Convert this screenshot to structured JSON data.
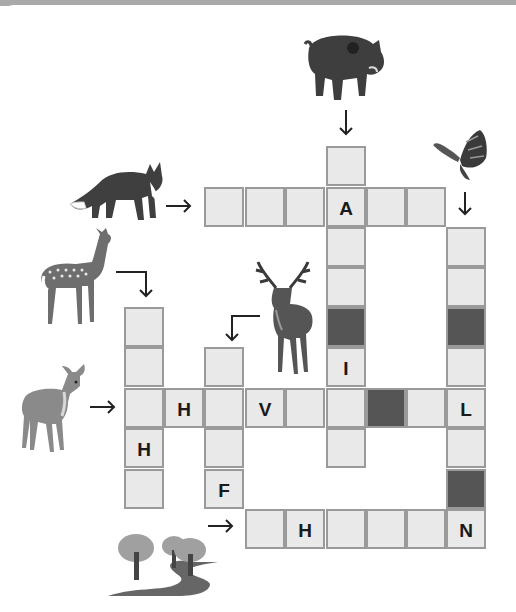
{
  "puzzle": {
    "type": "picture crossword",
    "colors": {
      "cell_fill": "#e9e9e9",
      "cell_border": "#9a9a9a",
      "blocked_cell": "#555555",
      "letter": "#1a1a1a"
    },
    "clues": [
      {
        "id": "boar",
        "picture": "wild-boar",
        "direction": "down",
        "start": [
          0,
          5
        ],
        "length": 8
      },
      {
        "id": "fox",
        "picture": "fox",
        "direction": "across",
        "start": [
          1,
          2
        ],
        "length": 6
      },
      {
        "id": "butterfly",
        "picture": "butterfly",
        "direction": "down",
        "start": [
          2,
          8
        ],
        "length": 8
      },
      {
        "id": "doe",
        "picture": "spotted-doe",
        "direction": "down",
        "start": [
          4,
          0
        ],
        "length": 5
      },
      {
        "id": "stag",
        "picture": "stag",
        "direction": "down",
        "start": [
          5,
          2
        ],
        "length": 4
      },
      {
        "id": "fawn",
        "picture": "fawn",
        "direction": "across",
        "start": [
          6,
          0
        ],
        "length": 9
      },
      {
        "id": "forest",
        "picture": "trees-and-path",
        "direction": "across",
        "start": [
          9,
          3
        ],
        "length": 6
      }
    ],
    "cells": [
      {
        "r": 0,
        "c": 5,
        "letter": ""
      },
      {
        "r": 1,
        "c": 2,
        "letter": ""
      },
      {
        "r": 1,
        "c": 3,
        "letter": ""
      },
      {
        "r": 1,
        "c": 4,
        "letter": ""
      },
      {
        "r": 1,
        "c": 5,
        "letter": "A"
      },
      {
        "r": 1,
        "c": 6,
        "letter": ""
      },
      {
        "r": 1,
        "c": 7,
        "letter": ""
      },
      {
        "r": 2,
        "c": 5,
        "letter": ""
      },
      {
        "r": 2,
        "c": 8,
        "letter": ""
      },
      {
        "r": 3,
        "c": 5,
        "letter": ""
      },
      {
        "r": 3,
        "c": 8,
        "letter": ""
      },
      {
        "r": 4,
        "c": 0,
        "letter": ""
      },
      {
        "r": 4,
        "c": 5,
        "letter": "",
        "blocked": true
      },
      {
        "r": 4,
        "c": 8,
        "letter": "",
        "blocked": true
      },
      {
        "r": 5,
        "c": 0,
        "letter": ""
      },
      {
        "r": 5,
        "c": 2,
        "letter": ""
      },
      {
        "r": 5,
        "c": 5,
        "letter": "I"
      },
      {
        "r": 5,
        "c": 8,
        "letter": ""
      },
      {
        "r": 6,
        "c": 0,
        "letter": ""
      },
      {
        "r": 6,
        "c": 1,
        "letter": "H"
      },
      {
        "r": 6,
        "c": 2,
        "letter": ""
      },
      {
        "r": 6,
        "c": 3,
        "letter": "V"
      },
      {
        "r": 6,
        "c": 4,
        "letter": ""
      },
      {
        "r": 6,
        "c": 5,
        "letter": ""
      },
      {
        "r": 6,
        "c": 6,
        "letter": "",
        "blocked": true
      },
      {
        "r": 6,
        "c": 7,
        "letter": ""
      },
      {
        "r": 6,
        "c": 8,
        "letter": "L"
      },
      {
        "r": 7,
        "c": 0,
        "letter": "H"
      },
      {
        "r": 7,
        "c": 2,
        "letter": ""
      },
      {
        "r": 7,
        "c": 5,
        "letter": ""
      },
      {
        "r": 7,
        "c": 8,
        "letter": ""
      },
      {
        "r": 8,
        "c": 0,
        "letter": ""
      },
      {
        "r": 8,
        "c": 2,
        "letter": "F"
      },
      {
        "r": 8,
        "c": 8,
        "letter": "",
        "blocked": true
      },
      {
        "r": 9,
        "c": 3,
        "letter": ""
      },
      {
        "r": 9,
        "c": 4,
        "letter": "H"
      },
      {
        "r": 9,
        "c": 5,
        "letter": ""
      },
      {
        "r": 9,
        "c": 6,
        "letter": ""
      },
      {
        "r": 9,
        "c": 7,
        "letter": ""
      },
      {
        "r": 9,
        "c": 8,
        "letter": "N"
      }
    ]
  }
}
